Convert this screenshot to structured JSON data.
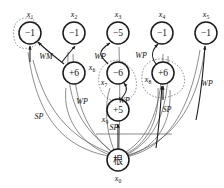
{
  "diagram": {
    "kind": "dependency-tree-graph",
    "background_color": "#ffffff",
    "node_stroke_color": "#1a1a1a",
    "edge_color": "#5a5a5a",
    "edge_dark_color": "#1f1f1f",
    "enclosure_color": "#6b6b6b",
    "nodes": [
      {
        "id": "x1",
        "name": "x",
        "sub": "1",
        "value": "−1",
        "cx": 30,
        "cy": 33,
        "r": 11,
        "label_x": 30,
        "label_y": 17,
        "script": "latin"
      },
      {
        "id": "x2",
        "name": "x",
        "sub": "2",
        "value": "−1",
        "cx": 74,
        "cy": 33,
        "r": 11,
        "label_x": 74,
        "label_y": 17,
        "script": "latin"
      },
      {
        "id": "x3",
        "name": "x",
        "sub": "3",
        "value": "−5",
        "cx": 118,
        "cy": 33,
        "r": 11,
        "label_x": 118,
        "label_y": 17,
        "script": "latin"
      },
      {
        "id": "x4",
        "name": "x",
        "sub": "4",
        "value": "−1",
        "cx": 162,
        "cy": 33,
        "r": 11,
        "label_x": 162,
        "label_y": 17,
        "script": "latin"
      },
      {
        "id": "x5",
        "name": "x",
        "sub": "5",
        "value": "−1",
        "cx": 206,
        "cy": 33,
        "r": 11,
        "label_x": 206,
        "label_y": 17,
        "script": "latin"
      },
      {
        "id": "x6",
        "name": "x",
        "sub": "6",
        "value": "+6",
        "cx": 74,
        "cy": 73,
        "r": 11,
        "label_x": 92,
        "label_y": 70,
        "script": "latin"
      },
      {
        "id": "x7",
        "name": "x",
        "sub": "7",
        "value": "−6",
        "cx": 118,
        "cy": 73,
        "r": 11,
        "label_x": 104,
        "label_y": 85,
        "script": "latin"
      },
      {
        "id": "x8",
        "name": "x",
        "sub": "8",
        "value": "+6",
        "cx": 163,
        "cy": 73,
        "r": 11,
        "label_x": 148,
        "label_y": 82,
        "script": "latin"
      },
      {
        "id": "x9",
        "name": "x",
        "sub": "9",
        "value": "+5",
        "cx": 118,
        "cy": 110,
        "r": 11,
        "label_x": 105,
        "label_y": 122,
        "script": "latin"
      },
      {
        "id": "x0",
        "name": "x",
        "sub": "0",
        "value": "根",
        "cx": 118,
        "cy": 160,
        "r": 11,
        "label_x": 118,
        "label_y": 181,
        "script": "cjk"
      }
    ],
    "edge_labels": [
      {
        "id": "wm-1",
        "text": "WM",
        "x": 46,
        "y": 59
      },
      {
        "id": "wp-1",
        "text": "WP",
        "x": 100,
        "y": 59
      },
      {
        "id": "wp-2",
        "text": "WP",
        "x": 141,
        "y": 58
      },
      {
        "id": "wp-3",
        "text": "WP",
        "x": 207,
        "y": 86
      },
      {
        "id": "wp-4",
        "text": "WP",
        "x": 82,
        "y": 104
      },
      {
        "id": "wp-5",
        "text": "WP",
        "x": 124,
        "y": 103
      },
      {
        "id": "sp-1",
        "text": "SP",
        "x": 39,
        "y": 119
      },
      {
        "id": "sp-2",
        "text": "SP",
        "x": 167,
        "y": 112
      },
      {
        "id": "sp-3",
        "text": "SP",
        "x": 114,
        "y": 130
      }
    ],
    "edges": [
      {
        "id": "e-x0-x1",
        "from": "x0",
        "to": "x1",
        "label": "SP"
      },
      {
        "id": "e-x0-x2",
        "from": "x0",
        "to": "x2",
        "label": "WP"
      },
      {
        "id": "e-x0-x3",
        "from": "x0",
        "to": "x3",
        "label": "WP"
      },
      {
        "id": "e-x0-x4",
        "from": "x0",
        "to": "x4",
        "label": "WP"
      },
      {
        "id": "e-x0-x5",
        "from": "x0",
        "to": "x5",
        "label": "WP"
      },
      {
        "id": "e-x0-x9",
        "from": "x0",
        "to": "x9",
        "label": "SP"
      },
      {
        "id": "e-x0-x8",
        "from": "x0",
        "to": "x8",
        "label": "SP"
      },
      {
        "id": "e-x6-x1",
        "from": "x6",
        "to": "x1",
        "label": "WM"
      },
      {
        "id": "e-x9-x7",
        "from": "x9",
        "to": "x7",
        "label": "WP"
      },
      {
        "id": "e-x7-x3",
        "from": "x7",
        "to": "x3",
        "label": "WP"
      },
      {
        "id": "e-x8-x4",
        "from": "x8",
        "to": "x4",
        "label": "WP"
      }
    ],
    "enclosures": [
      {
        "id": "loop-x1",
        "around": "x1"
      },
      {
        "id": "loop-x7-x9",
        "around": "x7"
      },
      {
        "id": "loop-x8",
        "around": "x8"
      }
    ]
  }
}
